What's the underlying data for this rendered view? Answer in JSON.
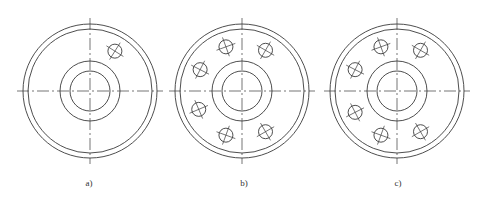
{
  "figures": [
    {
      "id": "a",
      "label": "a)",
      "center": [
        90,
        91
      ],
      "outer_rim_radius": 67,
      "inner_rim_radius": 62,
      "hub_outer_radius": 30,
      "hub_inner_radius": 20,
      "bolt_circle_radius": 47,
      "hole_radius": 7,
      "hole_angles_deg": [
        -58
      ]
    },
    {
      "id": "b",
      "label": "b)",
      "center": [
        242,
        91
      ],
      "outer_rim_radius": 67,
      "inner_rim_radius": 62,
      "hub_outer_radius": 30,
      "hub_inner_radius": 20,
      "bolt_circle_radius": 47,
      "hole_radius": 7,
      "hole_angles_deg": [
        -60,
        -110,
        -153,
        157,
        110,
        60
      ]
    },
    {
      "id": "c",
      "label": "c)",
      "center": [
        397,
        91
      ],
      "outer_rim_radius": 67,
      "inner_rim_radius": 62,
      "hub_outer_radius": 30,
      "hub_inner_radius": 20,
      "bolt_circle_radius": 47,
      "hole_radius": 7,
      "hole_angles_deg": [
        -60,
        -110,
        -153,
        153,
        110,
        60
      ]
    }
  ],
  "colors": {
    "line": "#3a3a3a",
    "background": "#ffffff"
  }
}
